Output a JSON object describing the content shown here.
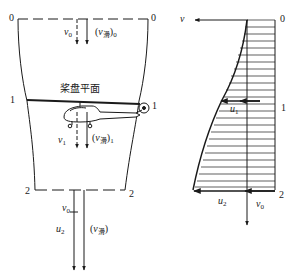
{
  "left_diagram": {
    "stations": [
      {
        "id": "0",
        "label_left": "0",
        "label_right": "0"
      },
      {
        "id": "1",
        "label_left": "1",
        "label_right": "1"
      },
      {
        "id": "2",
        "label_left": "2",
        "label_right": "2"
      }
    ],
    "rotor_plane_label": "桨盘平面",
    "velocities": {
      "v0": {
        "symbol": "v",
        "sub": "0"
      },
      "v_slip0": {
        "open": "(",
        "symbol": "v",
        "sub_inner": "滑",
        "close": ")",
        "sub": "0"
      },
      "v1": {
        "symbol": "v",
        "sub": "1"
      },
      "v_slip1": {
        "open": "(",
        "symbol": "v",
        "sub_inner": "滑",
        "close": ")",
        "sub": "1"
      },
      "v0_bottom": {
        "symbol": "v",
        "sub": "0"
      },
      "u2": {
        "symbol": "u",
        "sub": "2"
      },
      "v_slip": {
        "open": "(",
        "symbol": "v",
        "sub_inner": "滑",
        "close": ")"
      }
    }
  },
  "right_diagram": {
    "axis_label": "v",
    "stations": [
      "0",
      "1",
      "2"
    ],
    "labels": {
      "u1": {
        "symbol": "u",
        "sub": "1"
      },
      "u2": {
        "symbol": "u",
        "sub": "2"
      },
      "v0": {
        "symbol": "v",
        "sub": "0"
      }
    }
  }
}
